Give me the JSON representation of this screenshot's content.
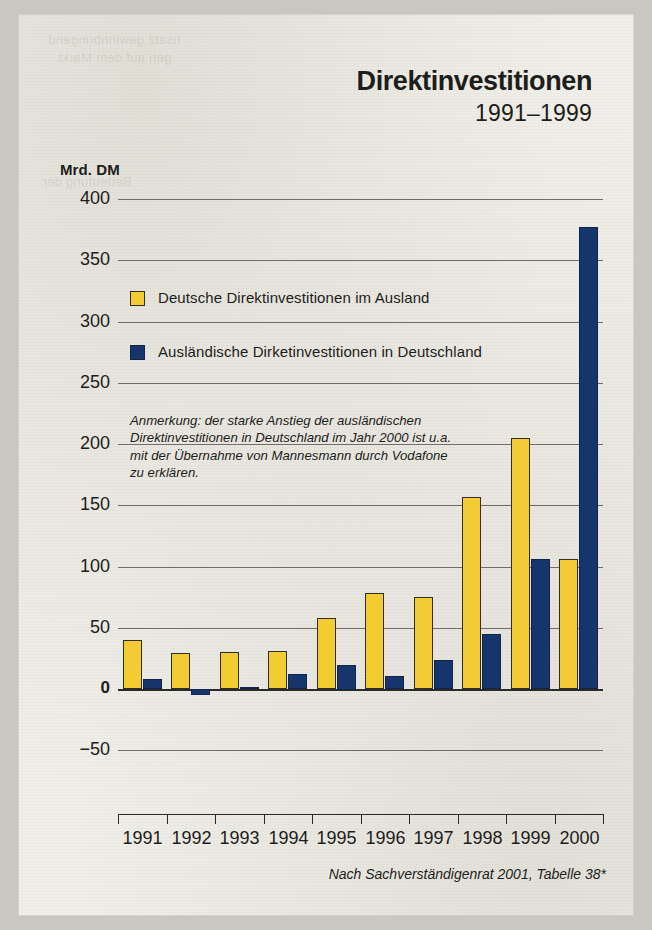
{
  "title": "Direktinvestitionen",
  "subtitle": "1991–1999",
  "unit_label": "Mrd. DM",
  "annotation": "Anmerkung: der starke Anstieg der ausländischen Direktinvestitionen in Deutschland im Jahr 2000 ist u.a. mit der Übernahme von Mannesmann durch Vodafone zu erklären.",
  "source": "Nach Sachverständigenrat  2001, Tabelle 38*",
  "colors": {
    "yellow": "#f3cc33",
    "navy": "#17356d",
    "paper": "#f0efe9",
    "ink": "#1d1d1b",
    "gridline": "#6f6d67"
  },
  "chart_data": {
    "type": "bar",
    "title": "Direktinvestitionen",
    "subtitle": "1991–1999",
    "xlabel": "",
    "ylabel": "Mrd. DM",
    "ylim": [
      -75,
      400
    ],
    "yticks": [
      400,
      350,
      300,
      250,
      200,
      150,
      100,
      50,
      0,
      -50
    ],
    "ytick_labels": [
      "400",
      "350",
      "300",
      "250",
      "200",
      "150",
      "100",
      "50",
      "0",
      "−50"
    ],
    "grid": true,
    "legend_position": "upper-left-inside",
    "categories": [
      "1991",
      "1992",
      "1993",
      "1994",
      "1995",
      "1996",
      "1997",
      "1998",
      "1999",
      "2000"
    ],
    "series": [
      {
        "name": "Deutsche Direktinvestitionen im Ausland",
        "color": "#f3cc33",
        "values": [
          40,
          29,
          30,
          31,
          58,
          78,
          75,
          157,
          205,
          106
        ]
      },
      {
        "name": "Ausländische Dirketinvestitionen in Deutschland",
        "color": "#17356d",
        "values": [
          8,
          -5,
          2,
          12,
          20,
          11,
          24,
          45,
          106,
          377
        ]
      }
    ],
    "annotations": [
      "Anmerkung: der starke Anstieg der ausländischen Direktinvestitionen in Deutschland im Jahr 2000 ist u.a. mit der Übernahme von Mannesmann durch Vodafone zu erklären."
    ],
    "source": "Nach Sachverständigenrat  2001, Tabelle 38*"
  },
  "legend": {
    "items": [
      {
        "label": "Deutsche Direktinvestitionen im Ausland",
        "color": "#f3cc33"
      },
      {
        "label": "Ausländische Dirketinvestitionen in Deutschland",
        "color": "#17356d"
      }
    ]
  }
}
